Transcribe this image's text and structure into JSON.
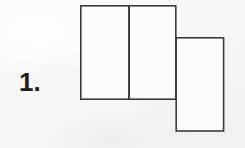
{
  "page": {
    "background_color": "#f8f8f8",
    "ink_color": "#3b3b3b",
    "width": 245,
    "height": 148
  },
  "item": {
    "number_label": "1.",
    "label_color": "#1d1d1d"
  },
  "figure": {
    "name": "three-rectangle-net",
    "rectangles": [
      {
        "name": "left-rectangle",
        "x": 80,
        "y": 5,
        "width": 49,
        "height": 94
      },
      {
        "name": "middle-rectangle",
        "x": 129,
        "y": 5,
        "width": 47,
        "height": 94
      },
      {
        "name": "right-rectangle",
        "x": 176,
        "y": 37,
        "width": 48,
        "height": 94
      }
    ],
    "shared_edges": [
      {
        "name": "left-middle-divider",
        "x1": 129,
        "y1": 5,
        "x2": 129,
        "y2": 99
      },
      {
        "name": "middle-right-divider",
        "x1": 176,
        "y1": 37,
        "x2": 176,
        "y2": 99
      }
    ]
  }
}
